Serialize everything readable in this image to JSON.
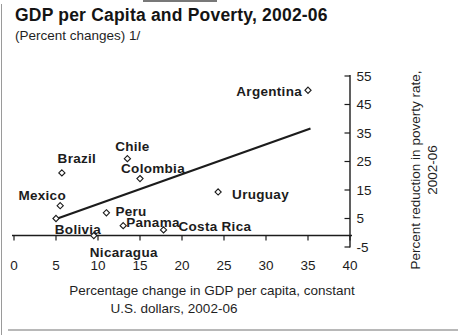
{
  "chart_data": {
    "type": "scatter",
    "title": "GDP per Capita and Poverty, 2002-06",
    "subtitle": "(Percent changes) 1/",
    "xlabel": "Percentage change in GDP per capita, constant U.S. dollars, 2002-06",
    "xlabel_lines": [
      "Percentage change in GDP per capita, constant",
      "U.S. dollars, 2002-06"
    ],
    "ylabel": "Percent reduction in poverty rate, 2002-06",
    "ylabel_lines": [
      "Percent reduction in poverty rate,",
      "2002-06"
    ],
    "xlim": [
      0,
      40
    ],
    "ylim": [
      -5,
      55
    ],
    "x_ticks": [
      0,
      5,
      10,
      15,
      20,
      25,
      30,
      35,
      40
    ],
    "y_ticks": [
      55,
      45,
      35,
      25,
      15,
      5,
      -5
    ],
    "grid": false,
    "legend": "none",
    "marker_style": "hollow-diamond",
    "ink_color": "#1c1c1c",
    "points": [
      {
        "name": "Argentina",
        "x": 35,
        "y": 50,
        "label_anchor": "end",
        "label_dx": -6,
        "label_dy": 1
      },
      {
        "name": "Chile",
        "x": 13.5,
        "y": 26,
        "label_anchor": "middle",
        "label_dx": 5,
        "label_dy": -12
      },
      {
        "name": "Brazil",
        "x": 5.7,
        "y": 21,
        "label_anchor": "middle",
        "label_dx": 15,
        "label_dy": -15
      },
      {
        "name": "Colombia",
        "x": 15,
        "y": 19,
        "label_anchor": "middle",
        "label_dx": 13,
        "label_dy": -10
      },
      {
        "name": "Uruguay",
        "x": 24.3,
        "y": 14.3,
        "label_anchor": "start",
        "label_dx": 14,
        "label_dy": 2
      },
      {
        "name": "Mexico",
        "x": 5.5,
        "y": 9.5,
        "label_anchor": "middle",
        "label_dx": -18,
        "label_dy": -10
      },
      {
        "name": "Peru",
        "x": 11,
        "y": 7,
        "label_anchor": "start",
        "label_dx": 9,
        "label_dy": -2
      },
      {
        "name": "Bolivia",
        "x": 5,
        "y": 5,
        "label_anchor": "middle",
        "label_dx": 22,
        "label_dy": 11
      },
      {
        "name": "Panama",
        "x": 13,
        "y": 2.5,
        "label_anchor": "start",
        "label_dx": 3,
        "label_dy": -3
      },
      {
        "name": "Costa Rica",
        "x": 17.8,
        "y": 1,
        "label_anchor": "start",
        "label_dx": 15,
        "label_dy": -4
      },
      {
        "name": "Nicaragua",
        "x": 9.5,
        "y": -1,
        "label_anchor": "middle",
        "label_dx": 30,
        "label_dy": 17
      }
    ],
    "trend_line": {
      "x1": 5,
      "y1": 4.8,
      "x2": 35.3,
      "y2": 36.6
    }
  }
}
